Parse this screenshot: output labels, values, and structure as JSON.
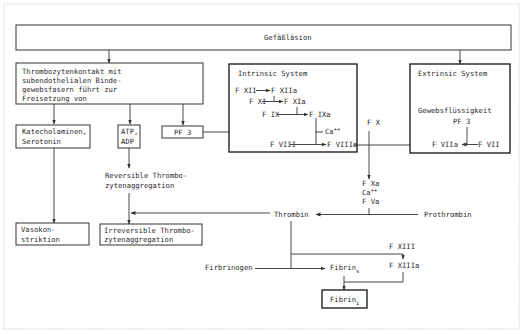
{
  "diagram": {
    "title": "Gefäßläsion",
    "platelet_box": {
      "lines": [
        "Thrombozytenkontakt mit",
        "subendothelialen Binde-",
        "gewebsfasern führt zur",
        "Freisetzung von"
      ]
    },
    "released": {
      "katecholamine": [
        "Katecholaminen,",
        "Serotonin"
      ],
      "atp_adp": [
        "ATP,",
        "ADP"
      ],
      "pf3": "PF 3"
    },
    "reversible": [
      "Reversible Thrombo-",
      "zytenaggregation"
    ],
    "vasokonstriktion": [
      "Vasokon-",
      "striktion"
    ],
    "irreversible": [
      "Irreversible Thrombo-",
      "zytenaggregation"
    ],
    "intrinsic": {
      "title": "Intrinsic System",
      "f12": "F XII",
      "f12a": "F XIIa",
      "f11": "F XI",
      "f11a": "F XIa",
      "f9": "F IX",
      "f9a": "F IXa",
      "ca": "Ca",
      "ca_sup": "++",
      "f8": "F VIII",
      "f8a": "F VIIIa"
    },
    "extrinsic": {
      "title": "Extrinsic System",
      "tissue": "Gewebsflüssigkeit",
      "pf3": "PF 3",
      "f7a": "F VIIa",
      "f7": "F VII"
    },
    "common": {
      "f10": "F X",
      "f10a": "F Xa",
      "ca": "Ca",
      "ca_sup": "++",
      "f5a": "F Va",
      "thrombin": "Thrombin",
      "prothrombin": "Prothrombin",
      "f13": "F XIII",
      "f13a": "F XIIIa",
      "fibrinogen": "Firbrinogen",
      "fibrin_s": "Fibrin",
      "fibrin_s_sub": "s",
      "fibrin_i": "Fibrin",
      "fibrin_i_sub": "i"
    }
  }
}
